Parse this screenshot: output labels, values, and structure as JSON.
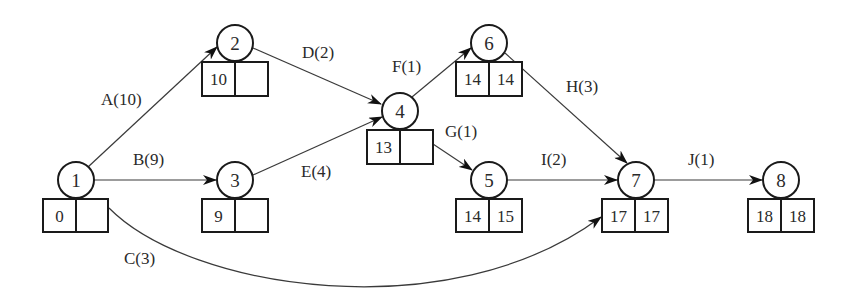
{
  "diagram": {
    "type": "activity-on-arrow network",
    "nodes": [
      {
        "id": "1",
        "label": "1",
        "cx": 76,
        "cy": 180,
        "es": "0",
        "ef": ""
      },
      {
        "id": "2",
        "label": "2",
        "cx": 235,
        "cy": 43,
        "es": "10",
        "ef": ""
      },
      {
        "id": "3",
        "label": "3",
        "cx": 235,
        "cy": 180,
        "es": "9",
        "ef": ""
      },
      {
        "id": "4",
        "label": "4",
        "cx": 400,
        "cy": 111,
        "es": "13",
        "ef": ""
      },
      {
        "id": "5",
        "label": "5",
        "cx": 489,
        "cy": 180,
        "es": "14",
        "ef": "15"
      },
      {
        "id": "6",
        "label": "6",
        "cx": 489,
        "cy": 43,
        "es": "14",
        "ef": "14"
      },
      {
        "id": "7",
        "label": "7",
        "cx": 636,
        "cy": 180,
        "es": "17",
        "ef": "17"
      },
      {
        "id": "8",
        "label": "8",
        "cx": 781,
        "cy": 180,
        "es": "18",
        "ef": "18"
      }
    ],
    "edges": [
      {
        "id": "A",
        "label": "A(10)",
        "from": "1",
        "to": "2",
        "duration": 10
      },
      {
        "id": "B",
        "label": "B(9)",
        "from": "1",
        "to": "3",
        "duration": 9
      },
      {
        "id": "C",
        "label": "C(3)",
        "from": "1",
        "to": "7",
        "duration": 3
      },
      {
        "id": "D",
        "label": "D(2)",
        "from": "2",
        "to": "4",
        "duration": 2
      },
      {
        "id": "E",
        "label": "E(4)",
        "from": "3",
        "to": "4",
        "duration": 4
      },
      {
        "id": "F",
        "label": "F(1)",
        "from": "4",
        "to": "6",
        "duration": 1
      },
      {
        "id": "G",
        "label": "G(1)",
        "from": "4",
        "to": "5",
        "duration": 1
      },
      {
        "id": "H",
        "label": "H(3)",
        "from": "6",
        "to": "7",
        "duration": 3
      },
      {
        "id": "I",
        "label": "I(2)",
        "from": "5",
        "to": "7",
        "duration": 2
      },
      {
        "id": "J",
        "label": "J(1)",
        "from": "7",
        "to": "8",
        "duration": 1
      }
    ]
  },
  "labels": {
    "node1": "1",
    "node2": "2",
    "node3": "3",
    "node4": "4",
    "node5": "5",
    "node6": "6",
    "node7": "7",
    "node8": "8",
    "box1_left": "0",
    "box1_right": "",
    "box2_left": "10",
    "box2_right": "",
    "box3_left": "9",
    "box3_right": "",
    "box4_left": "13",
    "box4_right": "",
    "box5_left": "14",
    "box5_right": "15",
    "box6_left": "14",
    "box6_right": "14",
    "box7_left": "17",
    "box7_right": "17",
    "box8_left": "18",
    "box8_right": "18",
    "edgeA": "A(10)",
    "edgeB": "B(9)",
    "edgeC": "C(3)",
    "edgeD": "D(2)",
    "edgeE": "E(4)",
    "edgeF": "F(1)",
    "edgeG": "G(1)",
    "edgeH": "H(3)",
    "edgeI": "I(2)",
    "edgeJ": "J(1)"
  },
  "colors": {
    "line": "#3a3a3a",
    "stroke": "#1a1a1a",
    "text": "#2a2a2a",
    "background": "#ffffff"
  }
}
